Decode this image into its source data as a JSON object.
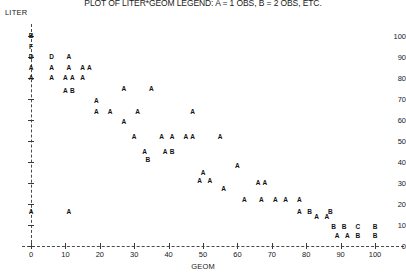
{
  "title": "PLOT OF LITER*GEOM  LEGEND: A = 1 OBS, B = 2 OBS, ETC.",
  "ylabel": "LITER",
  "xlabel": "GEOM",
  "chart_data": {
    "type": "scatter",
    "title": "PLOT OF LITER*GEOM  LEGEND: A = 1 OBS, B = 2 OBS, ETC.",
    "xlabel": "GEOM",
    "ylabel": "LITER",
    "xlim": [
      0,
      100
    ],
    "ylim": [
      0,
      100
    ],
    "xticks": [
      0,
      10,
      20,
      30,
      40,
      50,
      60,
      70,
      80,
      90,
      100
    ],
    "yticks": [
      0,
      10,
      20,
      30,
      40,
      50,
      60,
      70,
      80,
      90,
      100
    ],
    "grid": false,
    "legend": "A = 1 OBS, B = 2 OBS, ETC.",
    "marker_style": "letter-count",
    "points": [
      {
        "x": 0,
        "y": 100,
        "label": "B"
      },
      {
        "x": 0,
        "y": 95,
        "label": "F"
      },
      {
        "x": 0,
        "y": 90,
        "label": "D"
      },
      {
        "x": 0,
        "y": 85,
        "label": "A"
      },
      {
        "x": 0,
        "y": 80,
        "label": "A"
      },
      {
        "x": 0,
        "y": 16,
        "label": "A"
      },
      {
        "x": 6,
        "y": 90,
        "label": "D"
      },
      {
        "x": 6,
        "y": 85,
        "label": "A"
      },
      {
        "x": 6,
        "y": 80,
        "label": "A"
      },
      {
        "x": 11,
        "y": 90,
        "label": "A"
      },
      {
        "x": 11,
        "y": 85,
        "label": "A"
      },
      {
        "x": 10,
        "y": 80,
        "label": "A"
      },
      {
        "x": 12,
        "y": 80,
        "label": "A"
      },
      {
        "x": 10,
        "y": 74,
        "label": "A"
      },
      {
        "x": 12,
        "y": 74,
        "label": "B"
      },
      {
        "x": 11,
        "y": 16,
        "label": "A"
      },
      {
        "x": 15,
        "y": 85,
        "label": "A"
      },
      {
        "x": 15,
        "y": 80,
        "label": "A"
      },
      {
        "x": 17,
        "y": 85,
        "label": "A"
      },
      {
        "x": 19,
        "y": 69,
        "label": "A"
      },
      {
        "x": 19,
        "y": 64,
        "label": "A"
      },
      {
        "x": 23,
        "y": 64,
        "label": "A"
      },
      {
        "x": 27,
        "y": 75,
        "label": "A"
      },
      {
        "x": 27,
        "y": 59,
        "label": "A"
      },
      {
        "x": 30,
        "y": 52,
        "label": "A"
      },
      {
        "x": 31,
        "y": 64,
        "label": "A"
      },
      {
        "x": 33,
        "y": 45,
        "label": "A"
      },
      {
        "x": 34,
        "y": 41,
        "label": "B"
      },
      {
        "x": 35,
        "y": 75,
        "label": "A"
      },
      {
        "x": 38,
        "y": 52,
        "label": "A"
      },
      {
        "x": 41,
        "y": 52,
        "label": "A"
      },
      {
        "x": 39,
        "y": 45,
        "label": "A"
      },
      {
        "x": 41,
        "y": 45,
        "label": "B"
      },
      {
        "x": 45,
        "y": 52,
        "label": "A"
      },
      {
        "x": 47,
        "y": 52,
        "label": "A"
      },
      {
        "x": 47,
        "y": 64,
        "label": "A"
      },
      {
        "x": 50,
        "y": 35,
        "label": "A"
      },
      {
        "x": 49,
        "y": 31,
        "label": "A"
      },
      {
        "x": 52,
        "y": 31,
        "label": "A"
      },
      {
        "x": 55,
        "y": 52,
        "label": "A"
      },
      {
        "x": 56,
        "y": 27,
        "label": "A"
      },
      {
        "x": 60,
        "y": 38,
        "label": "A"
      },
      {
        "x": 62,
        "y": 22,
        "label": "A"
      },
      {
        "x": 66,
        "y": 30,
        "label": "A"
      },
      {
        "x": 68,
        "y": 30,
        "label": "A"
      },
      {
        "x": 67,
        "y": 22,
        "label": "A"
      },
      {
        "x": 71,
        "y": 22,
        "label": "A"
      },
      {
        "x": 74,
        "y": 22,
        "label": "A"
      },
      {
        "x": 78,
        "y": 16,
        "label": "A"
      },
      {
        "x": 81,
        "y": 16,
        "label": "B"
      },
      {
        "x": 83,
        "y": 14,
        "label": "A"
      },
      {
        "x": 86,
        "y": 14,
        "label": "A"
      },
      {
        "x": 87,
        "y": 16,
        "label": "B"
      },
      {
        "x": 88,
        "y": 9,
        "label": "B"
      },
      {
        "x": 91,
        "y": 9,
        "label": "B"
      },
      {
        "x": 89,
        "y": 5,
        "label": "A"
      },
      {
        "x": 92,
        "y": 5,
        "label": "A"
      },
      {
        "x": 95,
        "y": 5,
        "label": "B"
      },
      {
        "x": 95,
        "y": 9,
        "label": "C"
      },
      {
        "x": 100,
        "y": 9,
        "label": "B"
      },
      {
        "x": 100,
        "y": 5,
        "label": "B"
      },
      {
        "x": 78,
        "y": 22,
        "label": "A"
      }
    ]
  }
}
